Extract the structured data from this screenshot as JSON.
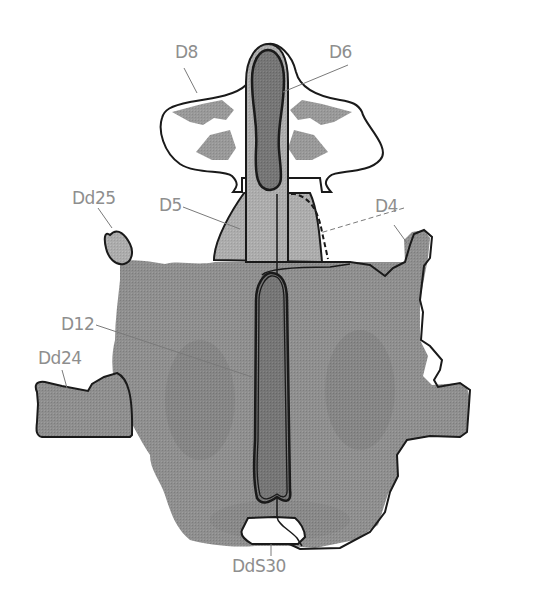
{
  "figure": {
    "colors": {
      "background": "#ffffff",
      "ink": "#8c8c8c",
      "ink_dark": "#6f6f6f",
      "ink_light": "#a8a8a8",
      "outline": "#1a1a1a",
      "label": "#8e8e8e",
      "leader": "#7a7a7a"
    },
    "labels": {
      "d8": "D8",
      "d6": "D6",
      "dd25": "Dd25",
      "d5": "D5",
      "d4": "D4",
      "d12": "D12",
      "dd24": "Dd24",
      "dds30": "DdS30"
    }
  }
}
